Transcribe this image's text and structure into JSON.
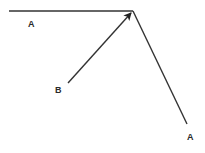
{
  "diagram": {
    "labels": {
      "a_top": "A",
      "b": "B",
      "a_bottom": "A"
    },
    "colors": {
      "stroke": "#333333",
      "background": "#ffffff"
    }
  }
}
